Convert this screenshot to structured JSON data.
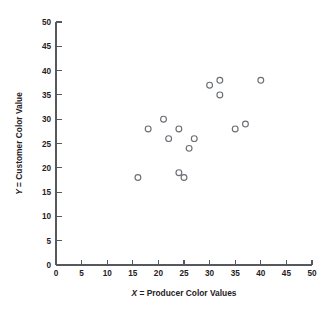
{
  "chart_data": {
    "type": "scatter",
    "title": "",
    "xlabel": "X = Producer Color Values",
    "xlabel_var": "X",
    "xlabel_rest": " = Producer Color Values",
    "ylabel": "Y = Customer Color Value",
    "ylabel_var": "Y",
    "ylabel_rest": " = Customer Color Value",
    "xlim": [
      0,
      50
    ],
    "ylim": [
      0,
      50
    ],
    "xticks": [
      0,
      5,
      10,
      15,
      20,
      25,
      30,
      35,
      40,
      45,
      50
    ],
    "yticks": [
      0,
      5,
      10,
      15,
      20,
      25,
      30,
      35,
      40,
      45,
      50
    ],
    "xtick_labels": [
      "0",
      "5",
      "10",
      "15",
      "20",
      "25",
      "30",
      "35",
      "40",
      "45",
      "50"
    ],
    "ytick_labels": [
      "0",
      "5",
      "10",
      "15",
      "20",
      "25",
      "30",
      "35",
      "40",
      "45",
      "50"
    ],
    "grid": false,
    "legend": null,
    "marker": "open-circle",
    "marker_color": "#6b6f75",
    "points": [
      {
        "x": 16,
        "y": 18
      },
      {
        "x": 18,
        "y": 28
      },
      {
        "x": 21,
        "y": 30
      },
      {
        "x": 22,
        "y": 26
      },
      {
        "x": 24,
        "y": 28
      },
      {
        "x": 24,
        "y": 19
      },
      {
        "x": 25,
        "y": 18
      },
      {
        "x": 26,
        "y": 24
      },
      {
        "x": 27,
        "y": 26
      },
      {
        "x": 30,
        "y": 37
      },
      {
        "x": 32,
        "y": 38
      },
      {
        "x": 32,
        "y": 35
      },
      {
        "x": 35,
        "y": 28
      },
      {
        "x": 37,
        "y": 29
      },
      {
        "x": 40,
        "y": 38
      }
    ],
    "n_points": 15
  },
  "figure": {
    "background": "#ffffff",
    "axis_color": "#55585c",
    "text_color": "#1f2124"
  }
}
